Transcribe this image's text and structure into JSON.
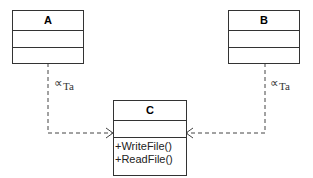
{
  "diagram": {
    "type": "UML class diagram",
    "classes": [
      {
        "name": "A",
        "attributes": [],
        "operations": []
      },
      {
        "name": "B",
        "attributes": [],
        "operations": []
      },
      {
        "name": "C",
        "attributes": [],
        "operations": [
          "+WriteFile()",
          "+ReadFile()"
        ]
      }
    ],
    "relations": [
      {
        "from": "A",
        "to": "C",
        "style": "dashed-open-arrow",
        "label_symbol": "∝",
        "label_sub": "Ta"
      },
      {
        "from": "B",
        "to": "C",
        "style": "dashed-open-arrow",
        "label_symbol": "∝",
        "label_sub": "Ta"
      }
    ],
    "colors": {
      "line": "#333333",
      "background": "#ffffff"
    }
  }
}
